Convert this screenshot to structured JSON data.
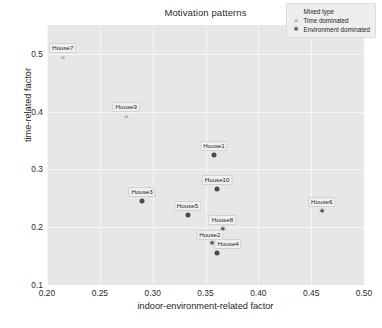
{
  "chart_data": {
    "type": "scatter",
    "title": "Motivation patterns",
    "xlabel": "indoor-environment-related factor",
    "ylabel": "time-related factor",
    "xlim": [
      0.2,
      0.5
    ],
    "ylim": [
      0.1,
      0.55
    ],
    "xticks": [
      "0.20",
      "0.25",
      "0.30",
      "0.35",
      "0.40",
      "0.45",
      "0.50"
    ],
    "xtick_values": [
      0.2,
      0.25,
      0.3,
      0.35,
      0.4,
      0.45,
      0.5
    ],
    "yticks": [
      "0.1",
      "0.2",
      "0.3",
      "0.4",
      "0.5"
    ],
    "ytick_values": [
      0.1,
      0.2,
      0.3,
      0.4,
      0.5
    ],
    "grid": true,
    "legend_position": "top-right",
    "series": [
      {
        "name": "Mixed type",
        "marker": "circle-marker",
        "color": "#4a4a4a",
        "points": [
          {
            "label": "House1",
            "x": 0.358,
            "y": 0.325
          },
          {
            "label": "House10",
            "x": 0.361,
            "y": 0.266
          },
          {
            "label": "House3",
            "x": 0.29,
            "y": 0.245
          },
          {
            "label": "House5",
            "x": 0.333,
            "y": 0.222
          },
          {
            "label": "House4",
            "x": 0.361,
            "y": 0.155
          }
        ]
      },
      {
        "name": "Time dominated",
        "marker": "cross-marker",
        "color": "#8a8a8a",
        "points": [
          {
            "label": "House7",
            "x": 0.215,
            "y": 0.495
          },
          {
            "label": "House9",
            "x": 0.275,
            "y": 0.393
          }
        ]
      },
      {
        "name": "Environment dominated",
        "marker": "star-marker",
        "color": "#3f3f3f",
        "points": [
          {
            "label": "House6",
            "x": 0.46,
            "y": 0.228
          },
          {
            "label": "House8",
            "x": 0.366,
            "y": 0.197
          },
          {
            "label": "House2",
            "x": 0.356,
            "y": 0.172
          }
        ]
      }
    ]
  },
  "legend": {
    "items": [
      {
        "label": "Mixed type",
        "glyph": "●"
      },
      {
        "label": "Time dominated",
        "glyph": "×"
      },
      {
        "label": "Environment dominated",
        "glyph": "✶"
      }
    ]
  },
  "colors": {
    "plot_background": "#e7e7e7",
    "grid": "#f6f6f6",
    "page_background": "#ffffff",
    "text": "#1e1e1e"
  }
}
